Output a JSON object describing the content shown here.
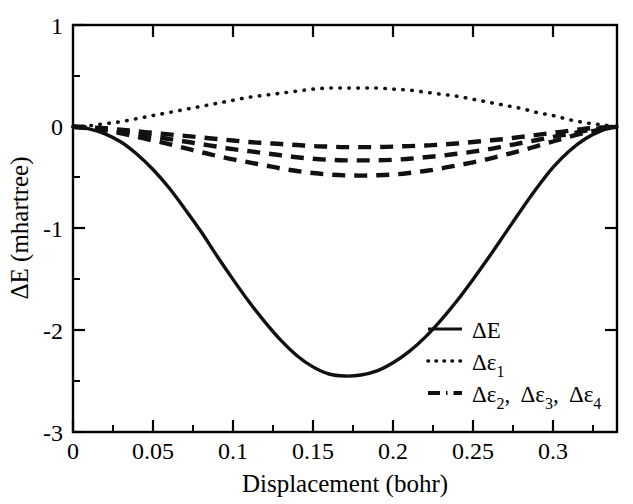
{
  "chart_data": {
    "type": "line",
    "title": "",
    "xlabel": "Displacement (bohr)",
    "ylabel": "ΔE (mhartree)",
    "xlim": [
      0,
      0.34
    ],
    "ylim": [
      -3,
      1
    ],
    "grid": false,
    "legend_position": "bottom-right",
    "x_ticks": [
      0,
      0.05,
      0.1,
      0.15,
      0.2,
      0.25,
      0.3
    ],
    "x_tick_labels": [
      "0",
      "0.05",
      "0.1",
      "0.15",
      "0.2",
      "0.25",
      "0.3"
    ],
    "x_minor_ticks": [
      0.025,
      0.075,
      0.125,
      0.175,
      0.225,
      0.275,
      0.325
    ],
    "y_ticks": [
      1,
      0,
      -1,
      -2,
      -3
    ],
    "y_tick_labels": [
      "1",
      "0",
      "-1",
      "-2",
      "-3"
    ],
    "y_minor_ticks": [
      0.5,
      -0.5,
      -1.5,
      -2.5
    ],
    "series": [
      {
        "name": "ΔE",
        "legend_label": "ΔE",
        "style": "solid",
        "x": [
          0,
          0.01,
          0.02,
          0.03,
          0.04,
          0.05,
          0.06,
          0.07,
          0.08,
          0.09,
          0.1,
          0.11,
          0.12,
          0.13,
          0.14,
          0.15,
          0.16,
          0.17,
          0.18,
          0.19,
          0.2,
          0.21,
          0.22,
          0.23,
          0.24,
          0.25,
          0.26,
          0.27,
          0.28,
          0.29,
          0.3,
          0.31,
          0.32,
          0.33,
          0.34
        ],
        "values": [
          0.0,
          -0.02,
          -0.07,
          -0.15,
          -0.27,
          -0.42,
          -0.6,
          -0.81,
          -1.03,
          -1.27,
          -1.5,
          -1.72,
          -1.92,
          -2.1,
          -2.25,
          -2.36,
          -2.43,
          -2.45,
          -2.44,
          -2.4,
          -2.32,
          -2.21,
          -2.07,
          -1.9,
          -1.71,
          -1.5,
          -1.28,
          -1.05,
          -0.82,
          -0.6,
          -0.4,
          -0.24,
          -0.12,
          -0.04,
          0.0
        ]
      },
      {
        "name": "Δε1",
        "legend_label": "Δε₁",
        "style": "dotted",
        "x": [
          0,
          0.01,
          0.02,
          0.03,
          0.04,
          0.05,
          0.06,
          0.07,
          0.08,
          0.09,
          0.1,
          0.11,
          0.12,
          0.13,
          0.14,
          0.15,
          0.16,
          0.17,
          0.18,
          0.19,
          0.2,
          0.21,
          0.22,
          0.23,
          0.24,
          0.25,
          0.26,
          0.27,
          0.28,
          0.29,
          0.3,
          0.31,
          0.32,
          0.33,
          0.34
        ],
        "values": [
          0.0,
          0.01,
          0.03,
          0.05,
          0.08,
          0.11,
          0.14,
          0.17,
          0.2,
          0.23,
          0.26,
          0.29,
          0.31,
          0.33,
          0.35,
          0.37,
          0.38,
          0.38,
          0.38,
          0.38,
          0.37,
          0.36,
          0.34,
          0.32,
          0.3,
          0.27,
          0.24,
          0.21,
          0.18,
          0.14,
          0.11,
          0.07,
          0.04,
          0.02,
          0.0
        ]
      },
      {
        "name": "Δε2",
        "legend_label": "Δε₂",
        "style": "dashed",
        "x": [
          0,
          0.01,
          0.02,
          0.03,
          0.04,
          0.05,
          0.06,
          0.07,
          0.08,
          0.09,
          0.1,
          0.11,
          0.12,
          0.13,
          0.14,
          0.15,
          0.16,
          0.17,
          0.18,
          0.19,
          0.2,
          0.21,
          0.22,
          0.23,
          0.24,
          0.25,
          0.26,
          0.27,
          0.28,
          0.29,
          0.3,
          0.31,
          0.32,
          0.33,
          0.34
        ],
        "values": [
          0.0,
          -0.005,
          -0.015,
          -0.03,
          -0.045,
          -0.06,
          -0.075,
          -0.09,
          -0.105,
          -0.12,
          -0.135,
          -0.15,
          -0.16,
          -0.17,
          -0.18,
          -0.19,
          -0.195,
          -0.2,
          -0.2,
          -0.2,
          -0.195,
          -0.19,
          -0.185,
          -0.175,
          -0.165,
          -0.15,
          -0.135,
          -0.12,
          -0.1,
          -0.08,
          -0.06,
          -0.04,
          -0.02,
          -0.008,
          0.0
        ]
      },
      {
        "name": "Δε3",
        "legend_label": "Δε₃",
        "style": "dashed",
        "x": [
          0,
          0.01,
          0.02,
          0.03,
          0.04,
          0.05,
          0.06,
          0.07,
          0.08,
          0.09,
          0.1,
          0.11,
          0.12,
          0.13,
          0.14,
          0.15,
          0.16,
          0.17,
          0.18,
          0.19,
          0.2,
          0.21,
          0.22,
          0.23,
          0.24,
          0.25,
          0.26,
          0.27,
          0.28,
          0.29,
          0.3,
          0.31,
          0.32,
          0.33,
          0.34
        ],
        "values": [
          0.0,
          -0.01,
          -0.025,
          -0.045,
          -0.07,
          -0.095,
          -0.12,
          -0.145,
          -0.17,
          -0.195,
          -0.22,
          -0.24,
          -0.26,
          -0.28,
          -0.3,
          -0.315,
          -0.325,
          -0.33,
          -0.33,
          -0.33,
          -0.325,
          -0.315,
          -0.3,
          -0.285,
          -0.265,
          -0.245,
          -0.22,
          -0.19,
          -0.16,
          -0.13,
          -0.1,
          -0.07,
          -0.04,
          -0.015,
          0.0
        ]
      },
      {
        "name": "Δε4",
        "legend_label": "Δε₄",
        "style": "dashed",
        "x": [
          0,
          0.01,
          0.02,
          0.03,
          0.04,
          0.05,
          0.06,
          0.07,
          0.08,
          0.09,
          0.1,
          0.11,
          0.12,
          0.13,
          0.14,
          0.15,
          0.16,
          0.17,
          0.18,
          0.19,
          0.2,
          0.21,
          0.22,
          0.23,
          0.24,
          0.25,
          0.26,
          0.27,
          0.28,
          0.29,
          0.3,
          0.31,
          0.32,
          0.33,
          0.34
        ],
        "values": [
          0.0,
          -0.015,
          -0.035,
          -0.065,
          -0.1,
          -0.135,
          -0.17,
          -0.21,
          -0.25,
          -0.285,
          -0.32,
          -0.35,
          -0.38,
          -0.41,
          -0.435,
          -0.455,
          -0.47,
          -0.478,
          -0.48,
          -0.477,
          -0.47,
          -0.455,
          -0.435,
          -0.41,
          -0.38,
          -0.35,
          -0.315,
          -0.275,
          -0.235,
          -0.19,
          -0.145,
          -0.1,
          -0.06,
          -0.025,
          0.0
        ]
      }
    ],
    "legend_entries": [
      {
        "label": "ΔE",
        "style": "solid"
      },
      {
        "label": "Δε₁",
        "style": "dotted"
      },
      {
        "label": "Δε₂,  Δε₃,  Δε₄",
        "style": "dash-dot"
      }
    ]
  },
  "legend": {
    "entry1_main": "ΔE",
    "entry2_main": "Δε",
    "entry2_sub": "1",
    "entry3_main_a": "Δε",
    "entry3_sub_a": "2",
    "entry3_sep_a": ",",
    "entry3_main_b": "Δε",
    "entry3_sub_b": "3",
    "entry3_sep_b": ",",
    "entry3_main_c": "Δε",
    "entry3_sub_c": "4"
  },
  "axes": {
    "x_title": "Displacement (bohr)",
    "y_title_delta": "ΔE (mhartree)"
  }
}
